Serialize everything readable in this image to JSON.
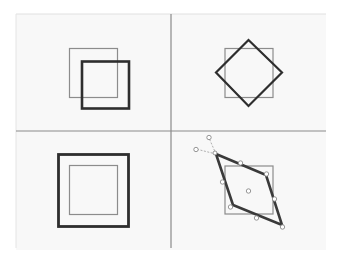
{
  "figure": {
    "colors": {
      "background": "#ffffff",
      "panel_bg": "#f7f7f7",
      "grid_line": "#8a8a8a",
      "thin_outline": "#8c8c8c",
      "thick_outline": "#2e2e2e",
      "handle": "#8a8a8a"
    },
    "panels": [
      {
        "name": "translate",
        "label": "Offset square"
      },
      {
        "name": "rotate",
        "label": "Rotated square"
      },
      {
        "name": "scale",
        "label": "Scaled square"
      },
      {
        "name": "skew",
        "label": "Skewed square with handles"
      }
    ]
  }
}
